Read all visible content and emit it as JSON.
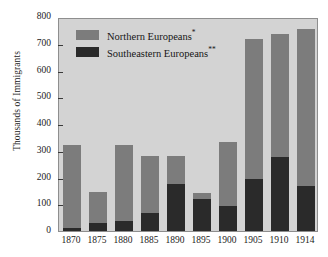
{
  "chart_data": {
    "type": "bar",
    "title": "",
    "subtitle": "",
    "xlabel": "",
    "ylabel": "Thousands of Immigrants",
    "ylim": [
      0,
      800
    ],
    "yticks": [
      0,
      100,
      200,
      300,
      400,
      500,
      600,
      700,
      800
    ],
    "ytick_labels": [
      "0",
      "100",
      "200",
      "300",
      "400",
      "500",
      "600",
      "700",
      "800"
    ],
    "grid": false,
    "stacked": true,
    "legend_position": "inside-top-left",
    "categories": [
      "1870",
      "1875",
      "1880",
      "1885",
      "1890",
      "1895",
      "1900",
      "1905",
      "1910",
      "1914"
    ],
    "series": [
      {
        "name": "Southeastern Europeans**",
        "color": "#2a2a2a",
        "values": [
          12,
          30,
          38,
          68,
          175,
          118,
          95,
          195,
          275,
          167
        ]
      },
      {
        "name": "Northern Europeans*",
        "color": "#7c7c7c",
        "values": [
          310,
          117,
          283,
          213,
          105,
          25,
          238,
          522,
          463,
          589
        ]
      }
    ],
    "totals": [
      322,
      147,
      321,
      281,
      280,
      143,
      333,
      717,
      738,
      756
    ],
    "annotations": [
      "* Northern Europeans",
      "** Southeastern Europeans"
    ]
  },
  "legend": {
    "items": [
      {
        "label": "Northern Europeans",
        "marker": "*",
        "swatch": "north"
      },
      {
        "label": "Southeastern Europeans",
        "marker": "**",
        "swatch": "south"
      }
    ]
  },
  "colors": {
    "north": "#7c7c7c",
    "south": "#2a2a2a",
    "plot_background": "#d3d3d3",
    "page_background": "#ffffff",
    "axis": "#3a3a3a",
    "text": "#1b1b1b"
  }
}
